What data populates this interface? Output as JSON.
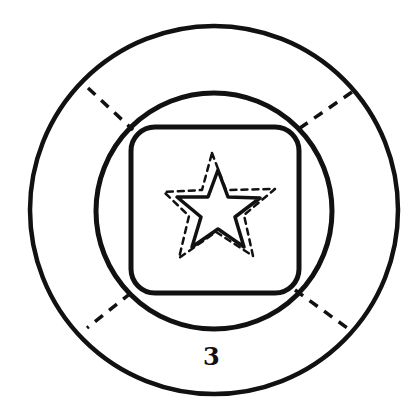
{
  "diagram": {
    "label": "3",
    "stroke_color": "#111111",
    "background": "#ffffff",
    "elements": [
      {
        "type": "outer-circle",
        "style": "solid"
      },
      {
        "type": "inner-circle",
        "style": "solid"
      },
      {
        "type": "rounded-square",
        "style": "solid"
      },
      {
        "type": "star",
        "style": "solid"
      },
      {
        "type": "star-outline",
        "style": "dashed"
      },
      {
        "type": "diagonal-lines",
        "style": "dashed",
        "count": 4
      }
    ]
  }
}
